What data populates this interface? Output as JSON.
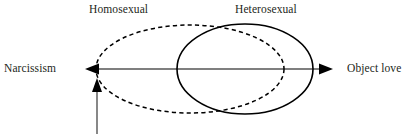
{
  "diagram": {
    "labels": {
      "homosexual": "Homosexual",
      "heterosexual": "Heterosexual",
      "narcissism": "Narcissism",
      "object_love": "Object love"
    },
    "colors": {
      "text": "#231f20",
      "stroke": "#000000",
      "axis": "#555555",
      "background": "#ffffff"
    },
    "axis": {
      "orientation": "horizontal",
      "left_end_label": "Narcissism",
      "right_end_label": "Object love",
      "left_arrow": "arrow-left",
      "right_arrow": "arrow-right",
      "y": 69,
      "x_start": 85,
      "x_end": 333
    },
    "pointer": {
      "name": "upward-pointer-arrow",
      "direction": "up",
      "x": 97,
      "y_tail": 134,
      "y_tip": 78,
      "annotation": ""
    },
    "shapes": [
      {
        "name": "homosexual-ellipse",
        "label": "Homosexual",
        "style": "dashed",
        "cx": 190,
        "cy": 69,
        "rx": 94,
        "ry": 44
      },
      {
        "name": "heterosexual-ellipse",
        "label": "Heterosexual",
        "style": "solid",
        "cx": 245,
        "cy": 69,
        "rx": 68,
        "ry": 45
      }
    ]
  }
}
